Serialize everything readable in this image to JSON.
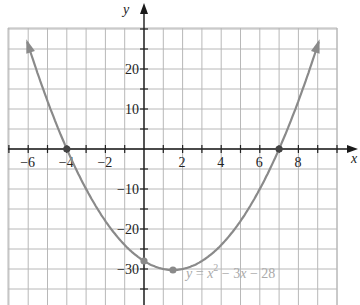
{
  "chart_data": {
    "type": "line",
    "title": "",
    "equation_label": "y = x^2 − 3x − 28",
    "equation_parts": {
      "y": "y",
      "eq": " = ",
      "x": "x",
      "exp": "2",
      "rest1": " − 3",
      "x2": "x",
      "rest2": " − 28"
    },
    "function": "y = x^2 - 3x - 28",
    "xlabel": "x",
    "ylabel": "y",
    "xlim": [
      -7,
      10
    ],
    "ylim": [
      -37,
      30
    ],
    "grid": true,
    "x_ticks": [
      -6,
      -4,
      -2,
      2,
      4,
      6,
      8
    ],
    "x_tick_labels": [
      "−6",
      "−4",
      "−2",
      "2",
      "4",
      "6",
      "8"
    ],
    "y_ticks": [
      20,
      10,
      -10,
      -20,
      -30
    ],
    "y_tick_labels": [
      "20",
      "10",
      "−10",
      "−20",
      "−30"
    ],
    "series": [
      {
        "name": "y = x^2 − 3x − 28",
        "x": [
          -6,
          -5,
          -4,
          -3,
          -2,
          -1,
          0,
          1,
          1.5,
          2,
          3,
          4,
          5,
          6,
          7,
          8,
          9
        ],
        "y": [
          26,
          12,
          0,
          -10,
          -18,
          -24,
          -28,
          -30,
          -30.25,
          -30,
          -28,
          -24,
          -18,
          -10,
          0,
          12,
          26
        ]
      }
    ],
    "marked_points": [
      {
        "label": "x-intercept",
        "x": -4,
        "y": 0
      },
      {
        "label": "x-intercept",
        "x": 7,
        "y": 0
      },
      {
        "label": "y-intercept",
        "x": 0,
        "y": -28
      },
      {
        "label": "vertex",
        "x": 1.5,
        "y": -30.25
      }
    ],
    "colors": {
      "curve": "#8a8a8a",
      "grid": "#b8b8b8",
      "axis": "#1a1a1a",
      "equation": "#aaaaaa"
    }
  }
}
